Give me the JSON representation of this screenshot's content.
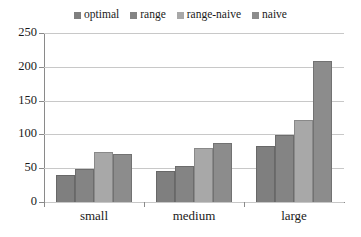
{
  "chart_data": {
    "type": "bar",
    "title": "",
    "subtitle": "",
    "xlabel": "",
    "ylabel": "",
    "categories": [
      "small",
      "medium",
      "large"
    ],
    "series": [
      {
        "name": "optimal",
        "color": "#7f7f7f",
        "values": [
          40,
          46,
          83
        ]
      },
      {
        "name": "range",
        "color": "#848484",
        "values": [
          49,
          54,
          99
        ]
      },
      {
        "name": "range-naive",
        "color": "#a8a8a8",
        "values": [
          74,
          80,
          121
        ]
      },
      {
        "name": "naive",
        "color": "#8c8c8c",
        "values": [
          71,
          87,
          209
        ]
      }
    ],
    "ylim": [
      0,
      250
    ],
    "yticks": [
      0,
      50,
      100,
      150,
      200,
      250
    ],
    "ytick_labels": [
      "0",
      "50",
      "100",
      "150",
      "200",
      "250"
    ],
    "grid": true,
    "grid_axis": "y",
    "legend_position": "top",
    "axis_color": "#8a8a8a",
    "grid_color": "#c8c8c8",
    "background": "#ffffff"
  },
  "legend": {
    "items": [
      {
        "label": "optimal"
      },
      {
        "label": "range"
      },
      {
        "label": "range-naive"
      },
      {
        "label": "naive"
      }
    ]
  },
  "axis": {
    "y_labels": [
      "250",
      "200",
      "150",
      "100",
      "50",
      "0"
    ],
    "x_labels": [
      "small",
      "medium",
      "large"
    ]
  }
}
